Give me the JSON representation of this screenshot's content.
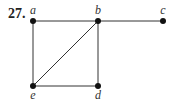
{
  "problem_number": "27.",
  "graph": {
    "nodes": [
      {
        "id": "a",
        "label": "a",
        "x": 33,
        "y": 21,
        "lx": 33,
        "ly": 14
      },
      {
        "id": "b",
        "label": "b",
        "x": 98,
        "y": 21,
        "lx": 98,
        "ly": 14
      },
      {
        "id": "c",
        "label": "c",
        "x": 163,
        "y": 21,
        "lx": 163,
        "ly": 14
      },
      {
        "id": "e",
        "label": "e",
        "x": 33,
        "y": 86,
        "lx": 33,
        "ly": 99
      },
      {
        "id": "d",
        "label": "d",
        "x": 98,
        "y": 86,
        "lx": 98,
        "ly": 99
      }
    ],
    "edges": [
      [
        "a",
        "b"
      ],
      [
        "b",
        "c"
      ],
      [
        "a",
        "e"
      ],
      [
        "b",
        "e"
      ],
      [
        "b",
        "d"
      ],
      [
        "e",
        "d"
      ]
    ]
  }
}
